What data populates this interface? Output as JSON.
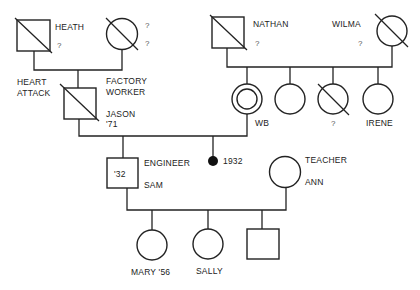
{
  "diagram": {
    "type": "genogram",
    "generation1": {
      "left_couple": {
        "male": {
          "name": "HEATH",
          "note": "?",
          "deceased": true
        },
        "female": {
          "name": "",
          "note1": "?",
          "note2": "?",
          "deceased": true
        }
      },
      "right_couple": {
        "male": {
          "name": "NATHAN",
          "note": "?",
          "deceased": true
        },
        "female": {
          "name": "WILMA",
          "note": "?",
          "deceased": true
        }
      }
    },
    "generation2": {
      "jason": {
        "name": "JASON",
        "year": "'71",
        "occupation_line1": "FACTORY",
        "occupation_line2": "WORKER",
        "cause_line1": "HEART",
        "cause_line2": "ATTACK",
        "deceased": true
      },
      "nathan_children": [
        {
          "name": "WB",
          "identified": true
        },
        {
          "name": ""
        },
        {
          "name": "?",
          "deceased": true
        },
        {
          "name": "IRENE"
        }
      ]
    },
    "generation3": {
      "sam": {
        "name": "SAM",
        "year": "'32",
        "occupation": "ENGINEER"
      },
      "miscarriage": {
        "year": "1932"
      },
      "ann": {
        "name": "ANN",
        "occupation": "TEACHER"
      }
    },
    "generation4": {
      "children": [
        {
          "name": "MARY '56",
          "sex": "female"
        },
        {
          "name": "SALLY",
          "sex": "female"
        },
        {
          "name": "",
          "sex": "male"
        }
      ]
    }
  }
}
